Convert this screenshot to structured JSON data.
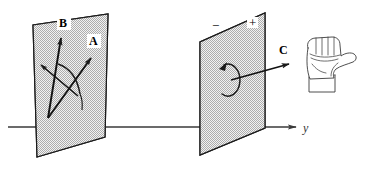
{
  "figure": {
    "background_color": "#ffffff",
    "plane_fill_color": "#c9c9c9",
    "plane_stroke_color": "#1a1a1a",
    "ink_color": "#1a1a1a"
  },
  "axis": {
    "label": "y",
    "label_x": 303,
    "label_y": 131,
    "line_start_x": 8,
    "line_end_x": 296,
    "line_y": 127
  },
  "left_plane": {
    "name": "plane-AB",
    "points": "37,157 33,25 108,14 105,137",
    "vectors": [
      {
        "id": "A",
        "label": "A",
        "label_x": 94,
        "label_y": 45,
        "tail_x": 48,
        "tail_y": 118,
        "tip_x": 91,
        "tip_y": 58
      },
      {
        "id": "B",
        "label": "B",
        "label_x": 64,
        "label_y": 26,
        "tail_x": 48,
        "tail_y": 118,
        "tip_x": 61,
        "tip_y": 38
      },
      {
        "id": "minus-B",
        "label": "",
        "label_x": 0,
        "label_y": 0,
        "tail_x": 76,
        "tail_y": 94,
        "tip_x": 41,
        "tip_y": 65
      }
    ],
    "angle_arc": "rotation arc from A to B"
  },
  "right_plane": {
    "name": "plane-C",
    "points": "200,155 200,42 265,13 265,128",
    "sign_minus": {
      "label": "−",
      "x": 216,
      "y": 26
    },
    "sign_plus": {
      "label": "+",
      "x": 252,
      "y": 24
    },
    "circulation": {
      "name": "counterclockwise-circulation-loop",
      "cx": 229,
      "cy": 79,
      "rx": 12,
      "ry": 16
    },
    "vector_C": {
      "id": "C",
      "label": "C",
      "label_x": 281,
      "label_y": 54,
      "tail_x": 231,
      "tail_y": 80,
      "tip_x": 289,
      "tip_y": 64
    }
  },
  "hand": {
    "name": "right-hand-fist-thumb-out",
    "description": "Right hand closed in a fist with thumb extended pointing to the right",
    "x": 302,
    "y": 34,
    "width": 56,
    "height": 58
  }
}
